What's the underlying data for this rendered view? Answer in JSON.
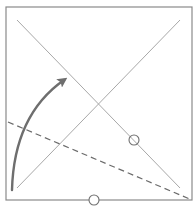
{
  "diagram": {
    "type": "origami-fold-instruction",
    "colors": {
      "background": "#ffffff",
      "square_border": "#8a8a8a",
      "crease_line": "#a8a8a8",
      "dashed_fold": "#6a6a6a",
      "arrow": "#6e6e6e",
      "marker_circle": "#707070"
    },
    "square": {
      "x": 6,
      "y": 7,
      "width": 186,
      "height": 193
    },
    "creases": [
      {
        "name": "diagonal-top-left-to-bottom-right",
        "x1": 17,
        "y1": 20,
        "x2": 180,
        "y2": 188
      },
      {
        "name": "diagonal-bottom-left-to-top-right",
        "x1": 17,
        "y1": 188,
        "x2": 180,
        "y2": 20
      }
    ],
    "fold_line": {
      "style": "dashed",
      "x1": 8,
      "y1": 122,
      "x2": 192,
      "y2": 200
    },
    "arrow": {
      "direction": "fold-up-right",
      "path": "M 12 190 Q 14 115 69 76",
      "head_tip": {
        "x": 69,
        "y": 76
      }
    },
    "markers": [
      {
        "name": "reference-point-on-diagonal",
        "cx": 134,
        "cy": 140,
        "r": 5
      },
      {
        "name": "reference-point-bottom-edge",
        "cx": 94,
        "cy": 200,
        "r": 5
      }
    ]
  }
}
